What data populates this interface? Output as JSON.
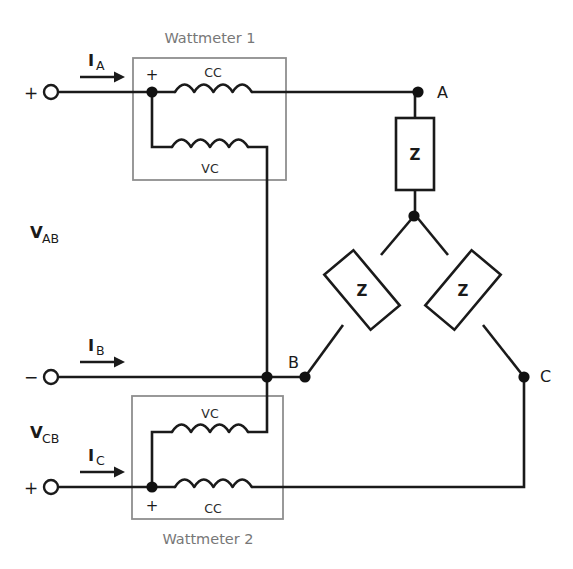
{
  "diagram": {
    "background_color": "#ffffff",
    "wire_color": "#1a1a1a",
    "meter_box_color": "#8e8e8e"
  },
  "meters": [
    {
      "id": "wattmeter-1",
      "label": "Wattmeter 1",
      "label_position": "top",
      "polarity_mark": "+",
      "coils": [
        {
          "name": "current-coil",
          "label": "CC",
          "label_position": "above"
        },
        {
          "name": "voltage-coil",
          "label": "VC",
          "label_position": "below"
        }
      ]
    },
    {
      "id": "wattmeter-2",
      "label": "Wattmeter 2",
      "label_position": "bottom",
      "polarity_mark": "+",
      "coils": [
        {
          "name": "voltage-coil",
          "label": "VC",
          "label_position": "above"
        },
        {
          "name": "current-coil",
          "label": "CC",
          "label_position": "below"
        }
      ]
    }
  ],
  "terminals": [
    {
      "id": "terminal-a",
      "sign": "+",
      "current_label": "I",
      "current_sub": "A"
    },
    {
      "id": "terminal-b",
      "sign": "−",
      "current_label": "I",
      "current_sub": "B"
    },
    {
      "id": "terminal-c",
      "sign": "+",
      "current_label": "I",
      "current_sub": "C"
    }
  ],
  "voltages": [
    {
      "id": "v-ab",
      "symbol": "V",
      "subscript": "AB"
    },
    {
      "id": "v-cb",
      "symbol": "V",
      "subscript": "CB"
    }
  ],
  "load": {
    "connection": "wye",
    "impedance_label": "Z",
    "branches": [
      {
        "id": "z-a",
        "label": "Z",
        "node": "A",
        "orientation": "vertical"
      },
      {
        "id": "z-b",
        "label": "Z",
        "node": "B",
        "orientation": "diagonal-left"
      },
      {
        "id": "z-c",
        "label": "Z",
        "node": "C",
        "orientation": "diagonal-right"
      }
    ]
  },
  "nodes": [
    {
      "id": "node-a",
      "label": "A"
    },
    {
      "id": "node-b",
      "label": "B"
    },
    {
      "id": "node-c",
      "label": "C"
    },
    {
      "id": "node-neutral",
      "label": ""
    }
  ]
}
